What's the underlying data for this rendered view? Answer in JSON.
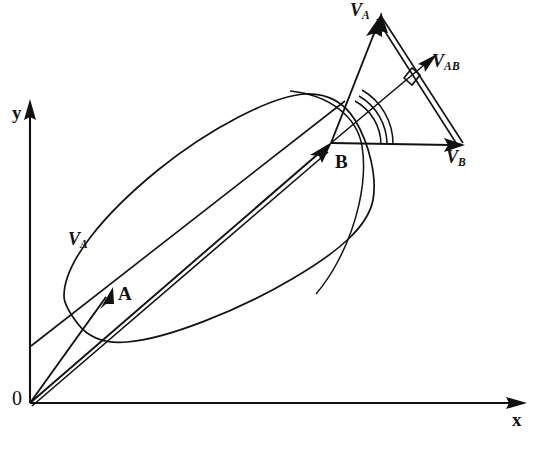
{
  "figure": {
    "kind": "vector-diagram",
    "background_color": "#ffffff",
    "ink_color": "#111111"
  },
  "axes": {
    "origin_label": "0",
    "x_label": "x",
    "y_label": "y",
    "origin_px": {
      "x": 30,
      "y": 403
    },
    "x_tip_px": {
      "x": 527,
      "y": 403
    },
    "y_tip_px": {
      "x": 30,
      "y": 99
    }
  },
  "points": [
    {
      "name": "A",
      "label": "A",
      "label_px": {
        "x": 120,
        "y": 286
      },
      "tip_px": {
        "x": 110,
        "y": 293
      }
    },
    {
      "name": "B",
      "label": "B",
      "label_px": {
        "x": 337,
        "y": 156
      },
      "tip_px": {
        "x": 331,
        "y": 143
      }
    }
  ],
  "vectors": [
    {
      "name": "velocity-of-A",
      "symbol": "V",
      "subscript": "A",
      "label_px": {
        "x": 70,
        "y": 234
      },
      "role": "velocity of point A (direction line through body)"
    },
    {
      "name": "velocity-of-A-triangle",
      "symbol": "V",
      "subscript": "A",
      "label_px": {
        "x": 352,
        "y": 4
      },
      "from_px": {
        "x": 331,
        "y": 143
      },
      "to_px": {
        "x": 382,
        "y": 13
      },
      "role": "velocity of A drawn from B in the velocity triangle"
    },
    {
      "name": "velocity-of-B",
      "symbol": "V",
      "subscript": "B",
      "label_px": {
        "x": 448,
        "y": 152
      },
      "from_px": {
        "x": 331,
        "y": 143
      },
      "to_px": {
        "x": 465,
        "y": 145
      },
      "role": "velocity of point B"
    },
    {
      "name": "relative-velocity-AB",
      "symbol": "V",
      "subscript": "AB",
      "label_px": {
        "x": 434,
        "y": 55
      },
      "from_px": {
        "x": 465,
        "y": 145
      },
      "to_px": {
        "x": 382,
        "y": 13
      },
      "role": "relative velocity of A with respect to B, perpendicular to AB"
    }
  ],
  "annotations": [
    {
      "name": "right-angle-mark",
      "meaning": "perpendicularity between V_AB and the line from B",
      "px": {
        "x": 410,
        "y": 74
      }
    },
    {
      "name": "angle-arc-inner",
      "meaning": "angle between V_B and the line to the body point"
    },
    {
      "name": "angle-arc-middle",
      "meaning": "angle between V_B and V_AB line"
    },
    {
      "name": "angle-arc-outer",
      "meaning": "angle between V_B and V_A"
    },
    {
      "name": "body-sweep-arc",
      "meaning": "large arc through the body at B"
    }
  ],
  "labels": {
    "origin": "0",
    "x": "x",
    "y": "y",
    "point_a": "A",
    "point_b": "B",
    "v": "V",
    "sub_a": "A",
    "sub_b": "B",
    "sub_ab": "AB"
  }
}
